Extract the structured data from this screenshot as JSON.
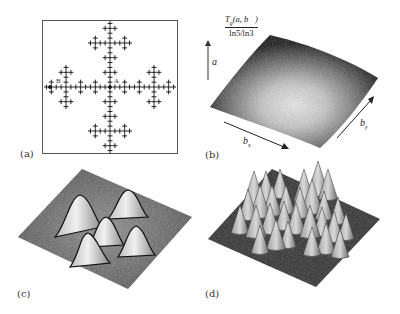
{
  "figure": {
    "panels": [
      {
        "id": "a",
        "label": "(a)",
        "content": "fractal-cross-set",
        "points": [
          {
            "name": "A",
            "position": "center"
          },
          {
            "name": "B",
            "position": "left-arm"
          }
        ]
      },
      {
        "id": "b",
        "label": "(b)",
        "content": "3d-surface-smooth-dome",
        "z_label_numerator": "T_g(a, b⃗)",
        "z_label_denominator": "ln5/ln3",
        "vertical_axis": "a",
        "x_axis": "b_x",
        "y_axis": "b_y"
      },
      {
        "id": "c",
        "label": "(c)",
        "content": "3d-surface-five-peaks"
      },
      {
        "id": "d",
        "label": "(d)",
        "content": "3d-surface-many-sharp-peaks"
      }
    ]
  },
  "labels": {
    "a": "(a)",
    "b": "(b)",
    "c": "(c)",
    "d": "(d)",
    "point_A": "A",
    "point_B": "B",
    "z_num_T": "T",
    "z_num_sub": "g",
    "z_num_rest": "(a, b⃗)",
    "z_den": "ln5/ln3",
    "axis_a": "a",
    "axis_bx_main": "b",
    "axis_bx_sub": "x",
    "axis_by_main": "b",
    "axis_by_sub": "y"
  }
}
